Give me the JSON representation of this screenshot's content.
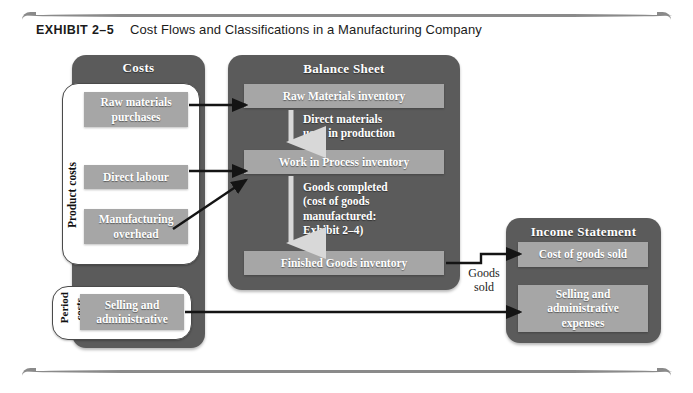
{
  "exhibit": {
    "label": "EXHIBIT 2–5",
    "title": "Cost Flows and Classifications in a Manufacturing Company"
  },
  "panels": {
    "costs": {
      "title": "Costs"
    },
    "balance_sheet": {
      "title": "Balance Sheet"
    },
    "income_statement": {
      "title": "Income Statement"
    }
  },
  "groups": {
    "product_costs": {
      "label": "Product costs"
    },
    "period_costs": {
      "label": "Period costs",
      "word1": "Period",
      "word2": "costs"
    }
  },
  "costs_items": [
    {
      "label": "Raw materials\npurchases"
    },
    {
      "label": "Direct labour"
    },
    {
      "label": "Manufacturing\noverhead"
    },
    {
      "label": "Selling and\nadministrative"
    }
  ],
  "balance_sheet_items": [
    {
      "label": "Raw Materials inventory"
    },
    {
      "label": "Work in Process inventory"
    },
    {
      "label": "Finished Goods inventory"
    }
  ],
  "balance_sheet_notes": [
    {
      "label": "Direct materials\nused in production"
    },
    {
      "label": "Goods completed\n(cost of goods\nmanufactured:\nExhibit 2–4)"
    }
  ],
  "income_statement_items": [
    {
      "label": "Cost of goods sold"
    },
    {
      "label": "Selling and\nadministrative\nexpenses"
    }
  ],
  "captions": {
    "goods_sold": "Goods\nsold"
  },
  "colors": {
    "panel_dark": "#5b5b5b",
    "chip_grey": "#a6a6a6",
    "white_box": "#ffffff",
    "text_light": "#ffffff",
    "text_dark": "#1b1b1b",
    "rule": "#8a8a8a"
  }
}
